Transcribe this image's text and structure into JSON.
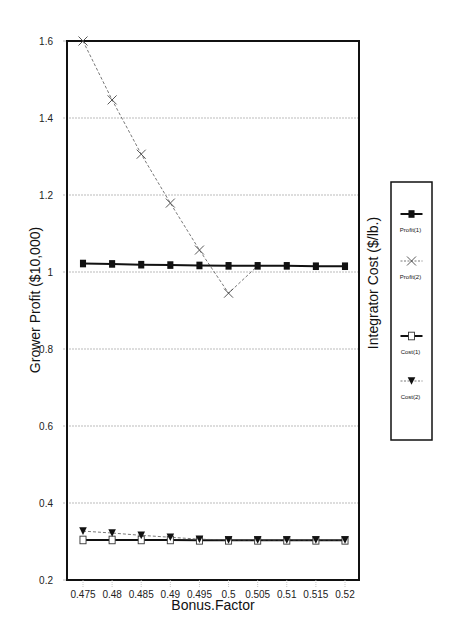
{
  "chart_data": {
    "type": "line",
    "title": "",
    "xlabel": "Bonus.Factor",
    "ylabel": "Grower Profit ($10,000)",
    "ylabel_right": "Integrator Cost ($/lb.)",
    "x": [
      0.475,
      0.48,
      0.485,
      0.49,
      0.495,
      0.5,
      0.505,
      0.51,
      0.515,
      0.52
    ],
    "x_tick_labels": [
      "0.475",
      "0.48",
      "0.485",
      "0.49",
      "0.495",
      "0.5",
      "0.505",
      "0.51",
      "0.515",
      "0.52"
    ],
    "ylim": [
      0.2,
      1.6
    ],
    "y_ticks": [
      0.2,
      0.4,
      0.6,
      0.8,
      1,
      1.2,
      1.4,
      1.6
    ],
    "y_tick_labels": [
      "0.2",
      "0.4",
      "0.6",
      "0.8",
      "1",
      "1.2",
      "1.4",
      "1.6"
    ],
    "grid": "horizontal dotted",
    "legend_position": "right",
    "series": [
      {
        "name": "Profit(1)",
        "marker": "filled-square",
        "line": "solid",
        "values": [
          1.022,
          1.021,
          1.019,
          1.018,
          1.017,
          1.016,
          1.016,
          1.016,
          1.015,
          1.015
        ]
      },
      {
        "name": "Profit(2)",
        "marker": "x",
        "line": "dashed",
        "values": [
          1.6,
          1.447,
          1.306,
          1.179,
          1.057,
          0.945,
          1.016,
          1.016,
          1.015,
          1.015
        ]
      },
      {
        "name": "Cost(1)",
        "marker": "open-square",
        "line": "solid",
        "values": [
          0.304,
          0.304,
          0.304,
          0.304,
          0.303,
          0.303,
          0.303,
          0.303,
          0.303,
          0.303
        ]
      },
      {
        "name": "Cost(2)",
        "marker": "filled-triangle-down",
        "line": "dashed",
        "values": [
          0.327,
          0.322,
          0.316,
          0.311,
          0.306,
          0.304,
          0.304,
          0.304,
          0.304,
          0.304
        ]
      }
    ]
  },
  "legend": {
    "items": [
      "Profit(1)",
      "Profit(2)",
      "Cost(1)",
      "Cost(2)"
    ]
  }
}
